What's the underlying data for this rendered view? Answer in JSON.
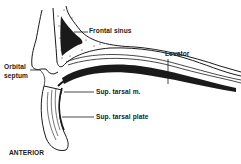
{
  "diagram": {
    "labels": {
      "frontal_sinus": "Frontal sinus",
      "levator": "Levator",
      "orbital_septum_line1": "Orbital",
      "orbital_septum_line2": "septum",
      "sup_tarsal_m": "Sup. tarsal m.",
      "sup_tarsal_plate": "Sup. tarsal plate",
      "orientation": "ANTERIOR"
    },
    "colors": {
      "ink": "#1a1a1a",
      "background": "#ffffff"
    }
  }
}
